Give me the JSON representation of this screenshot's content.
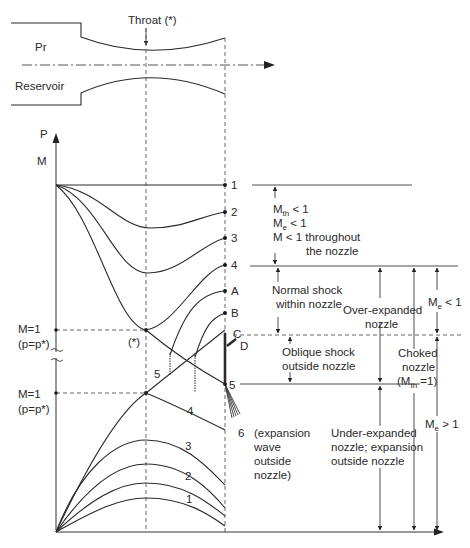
{
  "nozzle": {
    "throat_label": "Throat (*)",
    "inlet_label": "Pr",
    "reservoir_label": "Reservoir"
  },
  "axes": {
    "y_label_p": "P",
    "y_label_m": "M",
    "m1_upper": "M=1",
    "p_star_upper": "(p=p*)",
    "m1_lower": "M=1",
    "p_star_lower": "(p=p*)",
    "throat_marker": "(*)"
  },
  "pressure_curves": {
    "end_labels": [
      "1",
      "2",
      "3",
      "4",
      "A",
      "B",
      "C",
      "D",
      "5"
    ],
    "inline_label_5": "5",
    "expansion_label": "6"
  },
  "mach_curves": {
    "labels": [
      "5",
      "4",
      "3",
      "2",
      "1"
    ]
  },
  "annotations": {
    "subsonic": {
      "line1": "M",
      "line1_sub": "th",
      "line1_rest": " < 1",
      "line2": "M",
      "line2_sub": "e",
      "line2_rest": " < 1",
      "line3": "M < 1 throughout",
      "line4": "the nozzle"
    },
    "normal_shock": [
      "Normal shock",
      "within nozzle"
    ],
    "oblique_shock": [
      "Oblique shock",
      "outside nozzle"
    ],
    "expansion_wave": [
      "(expansion",
      "wave",
      "outside",
      "nozzle)"
    ],
    "over_expanded": [
      "Over-expanded",
      "nozzle"
    ],
    "under_expanded": [
      "Under-expanded",
      "nozzle; expansion",
      "outside nozzle"
    ],
    "choked": [
      "Choked",
      "nozzle",
      "(M",
      "th",
      " =1)"
    ],
    "me_lt_1": {
      "main": "M",
      "sub": "e",
      "rest": " < 1"
    },
    "me_gt_1": {
      "main": "M",
      "sub": "e",
      "rest": " > 1"
    }
  },
  "colors": {
    "line": "#2b2b2b",
    "background": "#ffffff"
  }
}
